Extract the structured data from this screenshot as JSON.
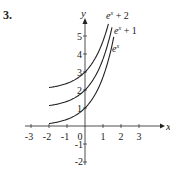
{
  "problem_number": "3.",
  "chart_data": {
    "type": "line",
    "title": "",
    "xlabel": "x",
    "ylabel": "y",
    "xlim": [
      -3,
      3
    ],
    "ylim": [
      -2,
      5
    ],
    "x_ticks": [
      "-3",
      "-2",
      "-1",
      "0",
      "1",
      "2",
      "3"
    ],
    "y_ticks": [
      "-2",
      "-1",
      "1",
      "2",
      "3",
      "4",
      "5"
    ],
    "grid": false,
    "series": [
      {
        "name": "e^x + 2",
        "x": [
          -2,
          -1,
          0,
          1,
          1.3
        ],
        "values": [
          2.14,
          2.37,
          3,
          4.72,
          5.67
        ]
      },
      {
        "name": "e^x + 1",
        "x": [
          -2,
          -1,
          0,
          1,
          1.5
        ],
        "values": [
          1.14,
          1.37,
          2,
          3.72,
          5.48
        ]
      },
      {
        "name": "e^x",
        "x": [
          -2,
          -1,
          0,
          1,
          1.5
        ],
        "values": [
          0.14,
          0.37,
          1,
          2.72,
          4.48
        ]
      }
    ],
    "legend": {
      "labels": [
        "e^x + 2",
        "e^x + 1",
        "e^x"
      ],
      "position": "curve-end annotations"
    }
  },
  "labels": {
    "x_axis": "x",
    "y_axis": "y",
    "curve1_base": "e",
    "curve1_sup": "x",
    "curve1_suffix": " + 2",
    "curve2_base": "e",
    "curve2_sup": "x",
    "curve2_suffix": " + 1",
    "curve3_base": "e",
    "curve3_sup": "x"
  }
}
